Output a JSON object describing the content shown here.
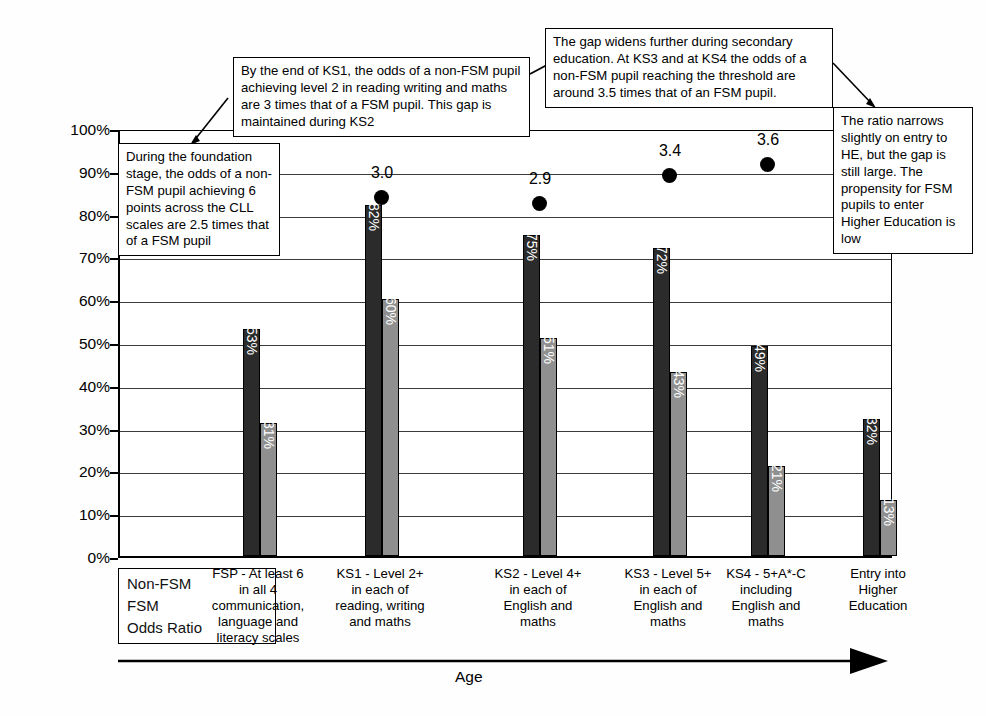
{
  "chart_data": {
    "type": "bar",
    "title": "",
    "xlabel": "Age",
    "ylabel": "Percentage reaching threshold",
    "ylim": [
      0,
      100
    ],
    "grid": true,
    "legend_position": "bottom-left",
    "ytick_labels": [
      "0%",
      "10%",
      "20%",
      "30%",
      "40%",
      "50%",
      "60%",
      "70%",
      "80%",
      "90%",
      "100%"
    ],
    "ytick_values": [
      0,
      10,
      20,
      30,
      40,
      50,
      60,
      70,
      80,
      90,
      100
    ],
    "categories": [
      "FSP - At least 6 in all 4 communication, language and literacy scales",
      "KS1 - Level 2+ in each of reading, writing and maths",
      "KS2 - Level 4+ in each of English and maths",
      "KS3 - Level 5+ in each of English and maths",
      "KS4 - 5+A*-C including English and maths",
      "Entry into Higher Education"
    ],
    "category_lines": [
      [
        "FSP - At least 6",
        "in all 4",
        "communication,",
        "language and",
        "literacy scales"
      ],
      [
        "KS1 - Level 2+",
        "in each of",
        "reading, writing",
        "and maths"
      ],
      [
        "KS2 - Level 4+",
        "in each of",
        "English and",
        "maths"
      ],
      [
        "KS3 - Level 5+",
        "in each of",
        "English and",
        "maths"
      ],
      [
        "KS4 - 5+A*-C",
        "including",
        "English and",
        "maths"
      ],
      [
        "Entry into",
        "Higher",
        "Education"
      ]
    ],
    "series": [
      {
        "name": "Non-FSM",
        "color": "#2b2b2b",
        "values": [
          53,
          82,
          75,
          72,
          49,
          32
        ],
        "labels": [
          "53%",
          "82%",
          "75%",
          "72%",
          "49%",
          "32%"
        ]
      },
      {
        "name": "FSM",
        "color": "#8f8f8f",
        "values": [
          31,
          60,
          51,
          43,
          21,
          13
        ],
        "labels": [
          "31%",
          "60%",
          "51%",
          "43%",
          "21%",
          "13%"
        ]
      }
    ],
    "odds_ratio": {
      "name": "Odds Ratio",
      "values": [
        2.5,
        3.0,
        2.9,
        3.4,
        3.6,
        3.1
      ],
      "labels": [
        "2.5",
        "3.0",
        "2.9",
        "3.4",
        "3.6",
        "3.1"
      ],
      "marker": "filled-circle"
    }
  },
  "legend": {
    "items": [
      {
        "label": "Non-FSM"
      },
      {
        "label": "FSM"
      },
      {
        "label": "Odds Ratio"
      }
    ]
  },
  "annotations": [
    {
      "id": "foundation-stage",
      "text": "During the foundation stage, the odds of a non-FSM pupil achieving 6 points across the CLL scales are 2.5 times that of a FSM pupil"
    },
    {
      "id": "ks1-ks2",
      "text": "By the end of KS1, the odds of a non-FSM pupil achieving level 2 in reading writing and maths are 3 times that of a FSM pupil. This gap is maintained during KS2"
    },
    {
      "id": "secondary",
      "text": "The gap widens further during secondary education. At KS3 and at KS4 the odds of a non-FSM pupil reaching the threshold are around 3.5 times that of an FSM pupil."
    },
    {
      "id": "higher-education",
      "text": "The ratio narrows slightly on entry to HE, but the gap is still large. The propensity for FSM pupils to enter Higher Education is low"
    }
  ],
  "axis": {
    "y_title": "Percentage reaching threshold",
    "x_title": "Age"
  }
}
